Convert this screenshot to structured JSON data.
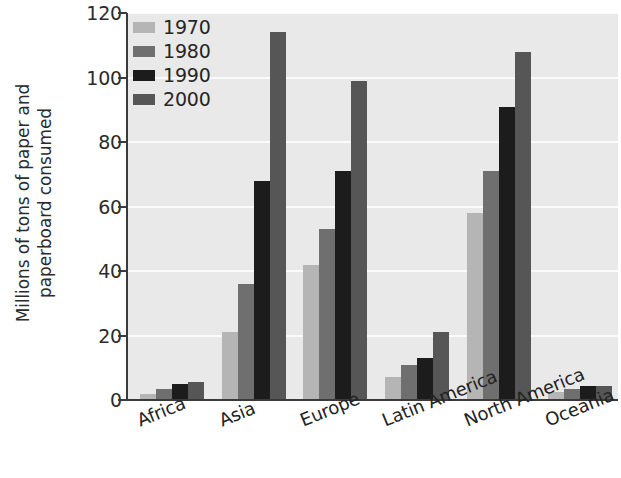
{
  "chart_data": {
    "type": "bar",
    "title": "",
    "subtitle": "",
    "xlabel": "",
    "ylabel": "Millions of tons of paper and paperboard consumed",
    "ylabel_lines": [
      "Millions of tons of paper and",
      "paperboard consumed"
    ],
    "categories": [
      "Africa",
      "Asia",
      "Europe",
      "Latin America",
      "North America",
      "Oceania"
    ],
    "series": [
      {
        "name": "1970",
        "color": "#b5b5b5",
        "values": [
          2,
          21,
          42,
          7,
          58,
          2.5
        ]
      },
      {
        "name": "1980",
        "color": "#6f6f6f",
        "values": [
          3.5,
          36,
          53,
          11,
          71,
          3.5
        ]
      },
      {
        "name": "1990",
        "color": "#1c1c1c",
        "values": [
          5,
          68,
          71,
          13,
          91,
          4.5
        ]
      },
      {
        "name": "2000",
        "color": "#565656",
        "values": [
          5.5,
          114,
          99,
          21,
          108,
          4.5
        ]
      }
    ],
    "ylim": [
      0,
      120
    ],
    "yticks": [
      0,
      20,
      40,
      60,
      80,
      100,
      120
    ],
    "ytick_labels": [
      "0",
      "20",
      "40",
      "60",
      "80",
      "100",
      "120"
    ],
    "grid": true,
    "grid_axis": "y",
    "legend_position": "top-left-inside",
    "plot_background": "#e9e9e9",
    "gridline_color": "#fbfbfb",
    "axis_color": "#3a3a3a"
  }
}
